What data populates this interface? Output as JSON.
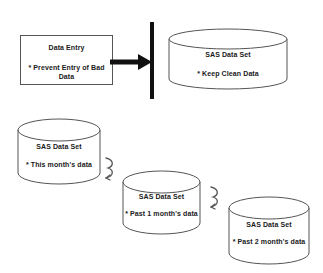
{
  "diagram": {
    "background_color": "#ffffff",
    "line_color": "#555555",
    "accent_color": "#111111",
    "text_color": "#1a1a1a"
  },
  "nodes": {
    "data_entry": {
      "shape": "rectangle",
      "title": "Data Entry",
      "detail": "* Prevent Entry of Bad Data"
    },
    "sas_clean": {
      "shape": "cylinder",
      "title": "SAS Data Set",
      "detail": "* Keep Clean Data"
    },
    "sas_this_month": {
      "shape": "cylinder",
      "title": "SAS Data Set",
      "detail": "* This month's data"
    },
    "sas_past_1": {
      "shape": "cylinder",
      "title": "SAS Data Set",
      "detail": "* Past 1 month's data"
    },
    "sas_past_2": {
      "shape": "cylinder",
      "title": "SAS Data Set",
      "detail": "* Past 2 month's data"
    }
  },
  "connectors": {
    "entry_arrow": {
      "icon": "right-arrow-icon"
    },
    "divider": {
      "icon": "vertical-bar-icon"
    },
    "curve_1": {
      "icon": "curved-arrow-icon"
    },
    "curve_2": {
      "icon": "curved-arrow-icon"
    }
  }
}
